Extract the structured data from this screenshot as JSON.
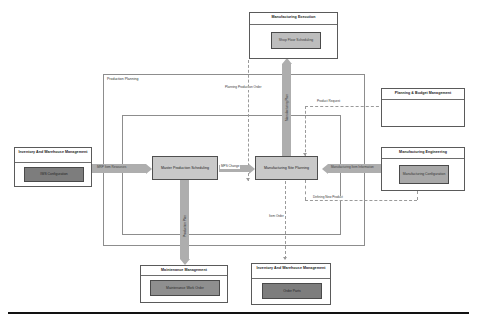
{
  "diagram": {
    "containers": [
      {
        "id": "production-planning",
        "label": "Production Planning"
      },
      {
        "id": "inner-planning",
        "label": ""
      }
    ],
    "systems": {
      "manufacturing_execution": {
        "title": "Manufacturing Execution",
        "module": "Shop Floor Scheduling"
      },
      "planning_budget": {
        "title": "Planning & Budget Management",
        "module": ""
      },
      "manufacturing_engineering": {
        "title": "Manufacturing Engineering",
        "module": "Manufacturing Configuration"
      },
      "inventory_warehouse_left": {
        "title": "Inventory And Warehouse Management",
        "module": "IWS Configuration"
      },
      "maintenance_management": {
        "title": "Maintenance Management",
        "module": "Maintenance Work Order"
      },
      "inventory_warehouse_bottom": {
        "title": "Inventory And Warehouse Management",
        "module": "Order Parts"
      }
    },
    "processes": {
      "master_production_scheduling": "Master Production Scheduling",
      "manufacturing_site_planning": "Manufacturing Site Planning"
    },
    "flows": {
      "mrp_item_resources": "MRP Item Resources",
      "mps_change": "MPS Change",
      "manufacturing_item_information": "Manufacturing Item Information",
      "planning_production_order": "Planning Production Order",
      "product_request": "Product Request",
      "defining_new_product": "Defining New Product",
      "production_plan": "Production Plan",
      "manufacturing_plan": "Manufacturing Plan",
      "item_order": "Item Order"
    },
    "colors": {
      "box_border": "#5a5a5a",
      "container_border": "#8d8d8d",
      "arrow_fill": "#aeaeae",
      "dashed_line": "#9a9a9a",
      "module_light": "#bdbdbd",
      "module_mid": "#a8a8a8",
      "module_dark": "#8f8f8f",
      "module_darker": "#7d7d7d",
      "process_fill": "#c9c9c9",
      "footer_rule": "#121212"
    }
  }
}
